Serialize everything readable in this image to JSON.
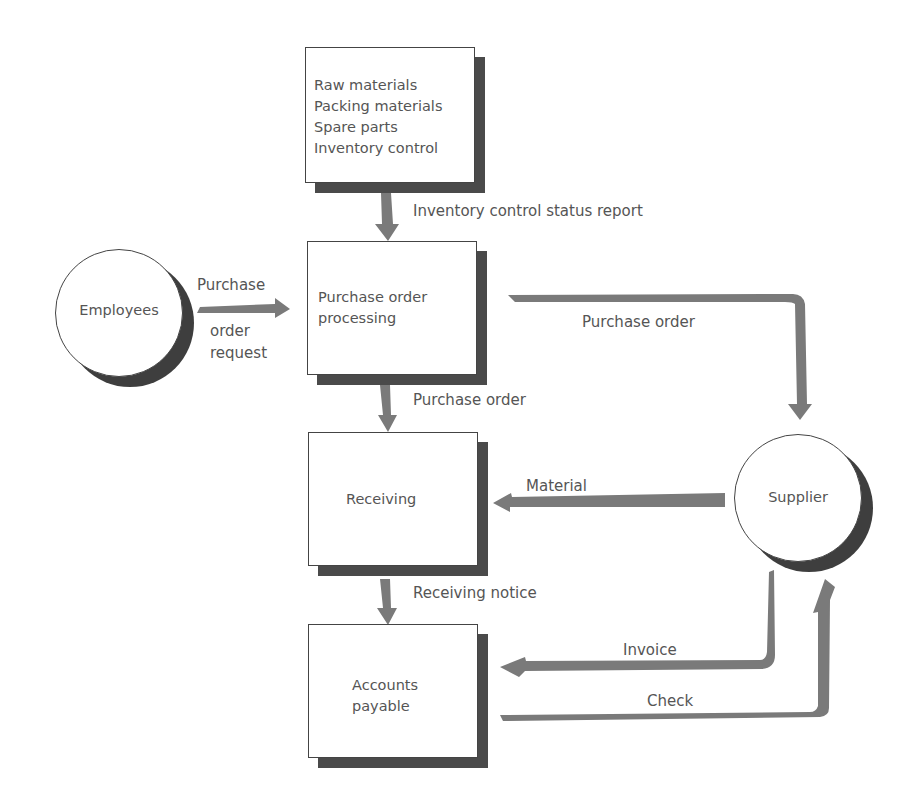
{
  "nodes": {
    "materials_store": {
      "lines": [
        "Raw materials",
        "Packing materials",
        "Spare parts",
        "Inventory control"
      ]
    },
    "po_processing": {
      "lines": [
        "Purchase order",
        "processing"
      ]
    },
    "receiving": {
      "label": "Receiving"
    },
    "accounts_payable": {
      "lines": [
        "Accounts",
        "payable"
      ]
    },
    "employees": {
      "label": "Employees"
    },
    "supplier": {
      "label": "Supplier"
    }
  },
  "flows": {
    "inventory_status": "Inventory control status report",
    "po_request_1": "Purchase",
    "po_request_2": "order",
    "po_request_3": "request",
    "po_to_supplier": "Purchase order",
    "po_to_receiving": "Purchase order",
    "material": "Material",
    "receiving_notice": "Receiving notice",
    "invoice": "Invoice",
    "check": "Check"
  },
  "colors": {
    "arrow": "#7a7a7a",
    "shadow": "#4a4a4a",
    "border": "#444444",
    "text": "#555555"
  }
}
